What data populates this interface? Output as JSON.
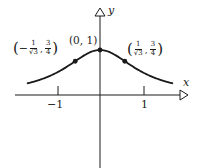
{
  "chart_data": {
    "type": "line",
    "title": "",
    "function": "y = 1/(1+x^2)",
    "xlabel": "x",
    "ylabel": "y",
    "xlim": [
      -2.0,
      2.0
    ],
    "ylim": [
      -1.6,
      1.9
    ],
    "grid": false,
    "x_ticks": [
      -1,
      1
    ],
    "x_tick_labels": [
      "−1",
      "1"
    ],
    "series": [
      {
        "name": "curve",
        "x": [
          -1.7,
          -1.5,
          -1.25,
          -1.0,
          -0.75,
          -0.577,
          -0.5,
          -0.25,
          0.0,
          0.25,
          0.5,
          0.577,
          0.75,
          1.0,
          1.25,
          1.5,
          1.7
        ],
        "y": [
          0.257,
          0.308,
          0.39,
          0.5,
          0.64,
          0.75,
          0.8,
          0.941,
          1.0,
          0.941,
          0.8,
          0.75,
          0.64,
          0.5,
          0.39,
          0.308,
          0.257
        ]
      }
    ],
    "marked_points": [
      {
        "x": -0.577,
        "y": 0.75,
        "label": "(−1/√3, 3/4)"
      },
      {
        "x": 0.0,
        "y": 1.0,
        "label": "(0, 1)"
      },
      {
        "x": 0.577,
        "y": 0.75,
        "label": "(1/√3, 3/4)"
      }
    ],
    "annotations": [
      "(0, 1)",
      "(−1/√3, 3/4)",
      "(1/√3, 3/4)"
    ]
  },
  "labels": {
    "x_axis": "x",
    "y_axis": "y",
    "tick_neg1": "−1",
    "tick_pos1": "1",
    "peak": "(0, 1)",
    "left_point": {
      "open": "(",
      "sign": "−",
      "x_num": "1",
      "x_den": "√3",
      "sep": ",",
      "y_num": "3",
      "y_den": "4",
      "close": ")"
    },
    "right_point": {
      "open": "(",
      "sign": "",
      "x_num": "1",
      "x_den": "√3",
      "sep": ",",
      "y_num": "3",
      "y_den": "4",
      "close": ")"
    }
  },
  "colors": {
    "ink": "#1a1a1a",
    "background": "#ffffff"
  }
}
